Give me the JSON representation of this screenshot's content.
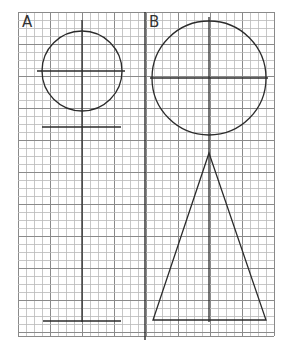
{
  "figure": {
    "grid": {
      "x0": 18,
      "y0": 12,
      "x1": 274,
      "y1": 336,
      "cell": 8,
      "major_every": 4,
      "minor_color": "#b9b9b9",
      "major_color": "#8a8a8a"
    },
    "divider_x": 145,
    "stroke_color": "#2b2b2b",
    "panels": [
      {
        "label": "A",
        "label_pos": {
          "x": 22,
          "y": 15
        },
        "axis": {
          "x": 82,
          "y_top": 20,
          "y_bottom": 322
        },
        "circle": {
          "cx": 82,
          "cy": 71,
          "r": 40,
          "h_axis": {
            "x1": 37,
            "x2": 125
          }
        },
        "crossbar": {
          "y": 127,
          "x1": 42,
          "x2": 121
        },
        "base_line": {
          "y": 321,
          "x1": 43,
          "x2": 121
        }
      },
      {
        "label": "B",
        "label_pos": {
          "x": 149,
          "y": 15
        },
        "axis": {
          "x": 209,
          "y_top": 17,
          "y_bottom": 322
        },
        "circle": {
          "cx": 209,
          "cy": 78,
          "r": 57,
          "h_axis": {
            "x1": 150,
            "x2": 268
          }
        },
        "triangle": {
          "apex": [
            209,
            153
          ],
          "base_left": [
            153,
            320
          ],
          "base_right": [
            266,
            320
          ]
        }
      }
    ]
  }
}
